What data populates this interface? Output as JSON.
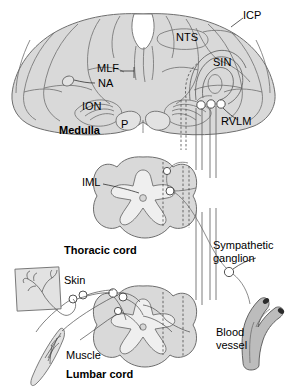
{
  "figure": {
    "palette": {
      "tissue_fill": "#d9d9d9",
      "tissue_fill_light": "#e2e2e2",
      "gray_matter_fill": "#efefef",
      "outline": "#6e6e6e",
      "outline_dark": "#4a4a4a",
      "label_color": "#000000",
      "vessel_fill": "#b9b9b9",
      "vessel_lumen": "#2b2b2b",
      "background": "#ffffff"
    }
  },
  "sections": {
    "medulla": {
      "name": "Medulla",
      "label": "Medulla",
      "bold": true,
      "structures": [
        {
          "abbr": "ICP",
          "name": "inferior-cerebellar-peduncle",
          "leader": true
        },
        {
          "abbr": "NTS",
          "name": "nucleus-tractus-solitarius",
          "leader": false
        },
        {
          "abbr": "SIN",
          "name": "spinal-trigeminal-nucleus",
          "leader": false
        },
        {
          "abbr": "MLF",
          "name": "medial-longitudinal-fasciculus",
          "leader": true
        },
        {
          "abbr": "NA",
          "name": "nucleus-ambiguus",
          "leader": true
        },
        {
          "abbr": "ION",
          "name": "inferior-olivary-nucleus",
          "leader": false
        },
        {
          "abbr": "P",
          "name": "pyramid",
          "leader": false
        },
        {
          "abbr": "RVLM",
          "name": "rostral-ventrolateral-medulla",
          "leader": true
        }
      ]
    },
    "thoracic_cord": {
      "name": "Thoracic cord",
      "label": "Thoracic cord",
      "bold": true,
      "structures": [
        {
          "abbr": "IML",
          "name": "intermediolateral-cell-column",
          "leader": true
        }
      ]
    },
    "lumbar_cord": {
      "name": "Lumbar cord",
      "label": "Lumbar cord",
      "bold": true,
      "structures": []
    }
  },
  "peripheral": {
    "skin": {
      "label": "Skin",
      "bold": false
    },
    "muscle": {
      "label": "Muscle",
      "bold": false
    },
    "sympathetic_ganglion": {
      "label_line1": "Sympathetic",
      "label_line2": "ganglion",
      "bold": false
    },
    "blood_vessel": {
      "label_line1": "Blood",
      "label_line2": "vessel",
      "bold": false
    }
  },
  "labels": {
    "icp": "ICP",
    "nts": "NTS",
    "sin": "SIN",
    "mlf": "MLF",
    "na": "NA",
    "ion": "ION",
    "p": "P",
    "rvlm": "RVLM",
    "medulla": "Medulla",
    "iml": "IML",
    "thoracic_cord": "Thoracic cord",
    "sympathetic_1": "Sympathetic",
    "sympathetic_2": "ganglion",
    "skin": "Skin",
    "muscle": "Muscle",
    "blood_1": "Blood",
    "blood_2": "vessel",
    "lumbar_cord": "Lumbar cord"
  }
}
